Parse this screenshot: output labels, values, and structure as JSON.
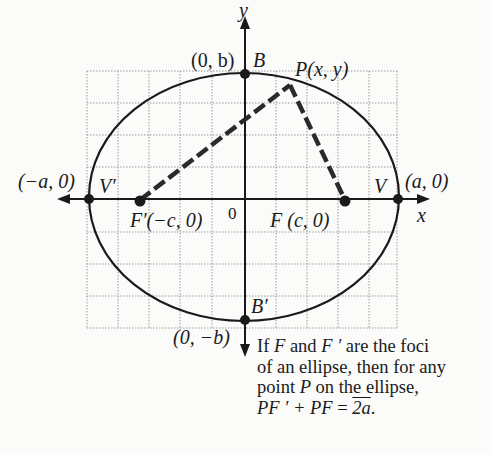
{
  "figure": {
    "axes": {
      "x_label": "x",
      "y_label": "y",
      "origin_label": "0"
    },
    "points": {
      "B": {
        "name": "B",
        "coords": "(0, b)"
      },
      "B_prime": {
        "name": "B′",
        "coords": "(0, −b)"
      },
      "V": {
        "name": "V",
        "coords": "(a, 0)"
      },
      "V_prime": {
        "name": "V′",
        "coords": "(−a, 0)"
      },
      "F": {
        "name": "F",
        "coords": "(c, 0)"
      },
      "F_prime": {
        "name": "F′",
        "coords": "(−c, 0)"
      },
      "P": {
        "name": "P",
        "coords": "(x, y)"
      }
    },
    "grid": {
      "columns": 10,
      "rows": 8
    },
    "colors": {
      "ink": "#1a1a1a",
      "grid": "#9a9a9a",
      "background": "#fbfbfa"
    }
  },
  "caption": {
    "line1_a": "If ",
    "line1_F": "F",
    "line1_b": " and ",
    "line1_Fp": "F ′",
    "line1_c": " are the foci",
    "line2": "of an ellipse, then for any",
    "line3_a": "point ",
    "line3_P": "P",
    "line3_b": " on the ellipse,",
    "line4_lhs": "PF ′ + PF",
    "line4_eq": " = ",
    "line4_rhs": "2a",
    "line4_end": "."
  }
}
